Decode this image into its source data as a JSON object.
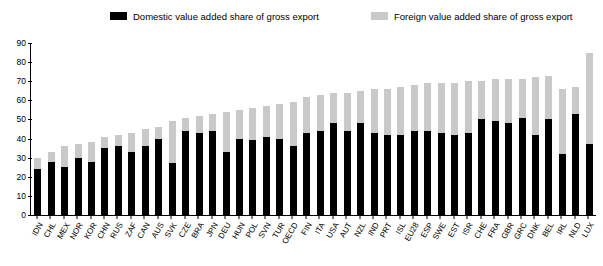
{
  "legend": {
    "position": "top",
    "entries": [
      {
        "label": "Domestic value added share of gross export",
        "color": "#000000",
        "name": "domestic"
      },
      {
        "label": "Foreign value added share of gross export",
        "color": "#c9c9c9",
        "name": "foreign"
      }
    ]
  },
  "axis": {
    "y_ticks": [
      0,
      10,
      20,
      30,
      40,
      50,
      60,
      70,
      80,
      90
    ],
    "y_min": 0,
    "y_max": 90
  },
  "chart_data": {
    "type": "bar",
    "title": "",
    "subtitle": "",
    "xlabel": "",
    "ylabel": "",
    "ylim": [
      0,
      90
    ],
    "grid": false,
    "stacked": true,
    "legend_position": "top",
    "categories": [
      "IDN",
      "CHL",
      "MEX",
      "NOR",
      "KOR",
      "CHN",
      "RUS",
      "ZAF",
      "CAN",
      "AUS",
      "SVK",
      "CZE",
      "BRA",
      "JPN",
      "DEU",
      "HUN",
      "POL",
      "SVN",
      "TUR",
      "OECD",
      "FIN",
      "ITA",
      "USA",
      "AUT",
      "NZL",
      "IND",
      "PRT",
      "ISL",
      "EU28",
      "ESP",
      "SWE",
      "EST",
      "ISR",
      "CHE",
      "FRA",
      "GBR",
      "GRC",
      "DNK",
      "BEL",
      "IRL",
      "NLD",
      "LUX"
    ],
    "series": [
      {
        "name": "Domestic value added share of gross export",
        "color": "#000000",
        "values": [
          24,
          28,
          25,
          30,
          28,
          35,
          36,
          33,
          36,
          40,
          27,
          44,
          43,
          44,
          33,
          40,
          39,
          41,
          40,
          36,
          43,
          44,
          48,
          44,
          48,
          43,
          42,
          42,
          44,
          44,
          43,
          42,
          43,
          50,
          49,
          48,
          51,
          42,
          50,
          32,
          53,
          37
        ]
      },
      {
        "name": "Foreign value added share of gross export",
        "color": "#c9c9c9",
        "values": [
          6,
          5,
          11,
          7,
          10,
          6,
          6,
          10,
          9,
          6,
          22,
          7,
          9,
          9,
          21,
          15,
          17,
          16,
          18,
          23,
          19,
          19,
          16,
          20,
          17,
          23,
          24,
          25,
          24,
          25,
          26,
          27,
          27,
          20,
          22,
          23,
          20,
          30,
          23,
          34,
          14,
          48
        ]
      }
    ],
    "note": "Stacked bars: total = domestic + foreign value added share of gross exports"
  }
}
